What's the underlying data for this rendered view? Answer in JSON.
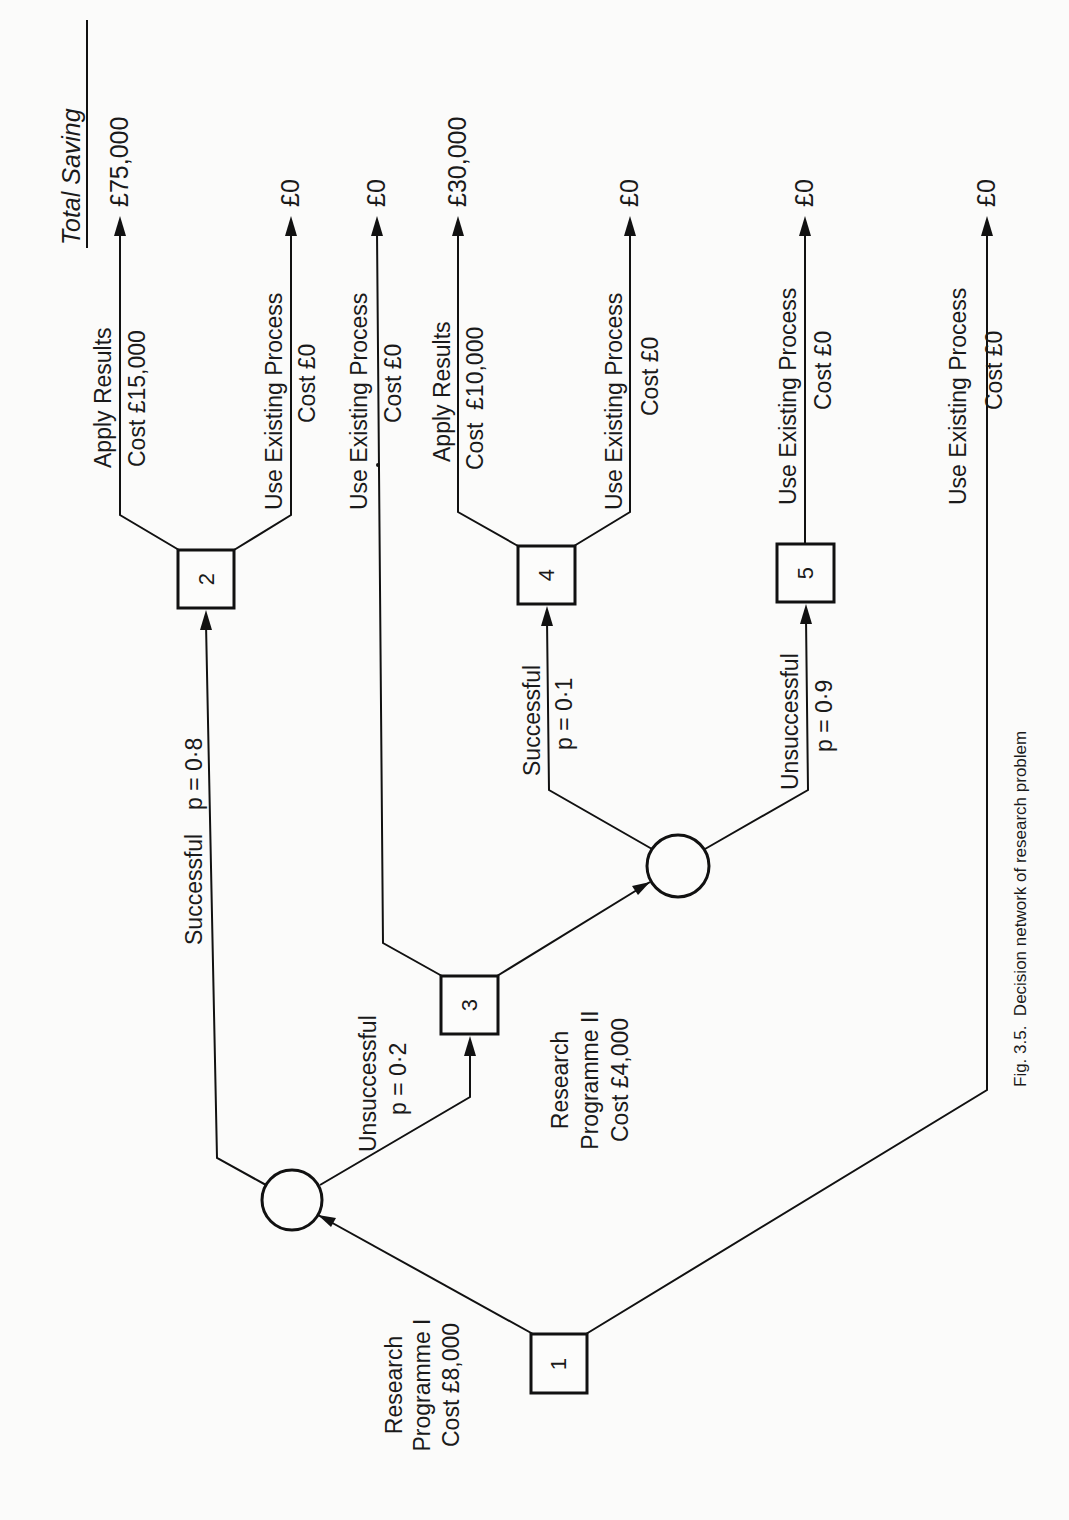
{
  "figure": {
    "caption": "Fig. 3.5.  Decision network of research problem",
    "orientation": "rotated-90-ccw",
    "header": "Total Saving"
  },
  "nodes": {
    "d1": {
      "type": "decision",
      "label": "1"
    },
    "c1": {
      "type": "chance",
      "label": ""
    },
    "d2": {
      "type": "decision",
      "label": "2"
    },
    "d3": {
      "type": "decision",
      "label": "3"
    },
    "c2": {
      "type": "chance",
      "label": ""
    },
    "d4": {
      "type": "decision",
      "label": "4"
    },
    "d5": {
      "type": "decision",
      "label": "5"
    }
  },
  "edges": {
    "d1_c1": {
      "line1": "Research",
      "line2": "Programme I",
      "line3": "Cost £8,000"
    },
    "d1_end": {
      "line1": "Use Existing Process",
      "line2": "Cost £0",
      "saving": "£0"
    },
    "c1_d2": {
      "outcome": "Successful",
      "probability": "p = 0·8"
    },
    "c1_d3": {
      "outcome": "Unsuccessful",
      "probability": "p = 0·2"
    },
    "d2_apply": {
      "line1": "Apply Results",
      "line2": "Cost £15,000",
      "saving": "£75,000"
    },
    "d2_existing": {
      "line1": "Use Existing Process",
      "line2": "Cost £0",
      "saving": "£0"
    },
    "d3_existing": {
      "line1": "Use Existing Process",
      "line2": "Cost £0",
      "saving": "£0"
    },
    "d3_c2": {
      "line1": "Research",
      "line2": "Programme II",
      "line3": "Cost £4,000"
    },
    "c2_d4": {
      "outcome": "Successful",
      "probability": "p = 0·1"
    },
    "c2_d5": {
      "outcome": "Unsuccessful",
      "probability": "p = 0·9"
    },
    "d4_apply": {
      "line1": "Apply Results",
      "line2": "Cost  £10,000",
      "saving": "£30,000"
    },
    "d4_existing": {
      "line1": "Use Existing Process",
      "line2": "Cost £0",
      "saving": "£0"
    },
    "d5_existing": {
      "line1": "Use Existing Process",
      "line2": "Cost £0",
      "saving": "£0"
    }
  },
  "colors": {
    "ink": "#111111",
    "paper": "#fbfbfa"
  }
}
